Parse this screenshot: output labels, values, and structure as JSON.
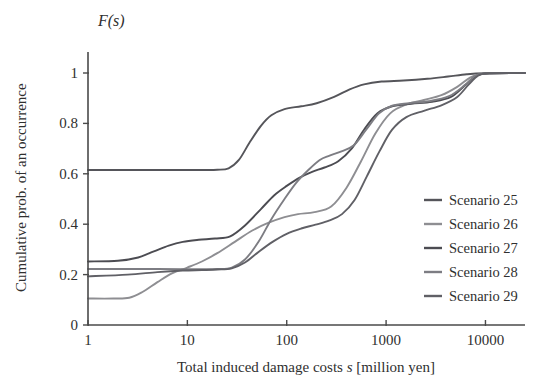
{
  "chart_data": {
    "type": "line",
    "title": "",
    "subtitle": "",
    "xlabel_parts": {
      "pre": "Total induced damage costs ",
      "symbol": "s",
      "post": "  [million yen]"
    },
    "xlabel": "Total induced damage costs s  [million yen]",
    "ylabel": "Cumulative prob. of  an occurrence",
    "corner_label": "F(s)",
    "xscale": "log",
    "xlim": [
      1,
      25000
    ],
    "ylim": [
      0,
      1
    ],
    "grid": false,
    "xticks": [
      1,
      10,
      100,
      1000,
      10000
    ],
    "xtick_labels": [
      "1",
      "10",
      "100",
      "1000",
      "10000"
    ],
    "yticks": [
      0,
      0.2,
      0.4,
      0.6,
      0.8,
      1
    ],
    "ytick_labels": [
      "0",
      "0.2",
      "0.4",
      "0.6",
      "0.8",
      "1"
    ],
    "legend_position": "right-middle",
    "series": [
      {
        "name": "Scenario 25",
        "color": "#55555a",
        "points": [
          [
            1,
            0.615
          ],
          [
            3,
            0.615
          ],
          [
            8,
            0.615
          ],
          [
            15,
            0.615
          ],
          [
            20,
            0.616
          ],
          [
            26,
            0.622
          ],
          [
            33,
            0.655
          ],
          [
            42,
            0.722
          ],
          [
            55,
            0.79
          ],
          [
            70,
            0.832
          ],
          [
            95,
            0.857
          ],
          [
            140,
            0.868
          ],
          [
            200,
            0.88
          ],
          [
            300,
            0.905
          ],
          [
            430,
            0.935
          ],
          [
            600,
            0.955
          ],
          [
            900,
            0.966
          ],
          [
            1500,
            0.97
          ],
          [
            2600,
            0.977
          ],
          [
            4200,
            0.986
          ],
          [
            6500,
            0.995
          ],
          [
            10000,
            0.999
          ],
          [
            25000,
            1.0
          ]
        ]
      },
      {
        "name": "Scenario 26",
        "color": "#8e8e92",
        "points": [
          [
            1,
            0.105
          ],
          [
            1.8,
            0.105
          ],
          [
            2.6,
            0.108
          ],
          [
            3.5,
            0.13
          ],
          [
            5,
            0.17
          ],
          [
            7,
            0.205
          ],
          [
            10,
            0.228
          ],
          [
            14,
            0.252
          ],
          [
            20,
            0.285
          ],
          [
            30,
            0.33
          ],
          [
            45,
            0.375
          ],
          [
            65,
            0.405
          ],
          [
            95,
            0.428
          ],
          [
            130,
            0.44
          ],
          [
            190,
            0.448
          ],
          [
            280,
            0.47
          ],
          [
            400,
            0.545
          ],
          [
            560,
            0.65
          ],
          [
            780,
            0.76
          ],
          [
            1100,
            0.84
          ],
          [
            1600,
            0.875
          ],
          [
            2400,
            0.893
          ],
          [
            3600,
            0.912
          ],
          [
            5200,
            0.945
          ],
          [
            7000,
            0.982
          ],
          [
            9000,
            0.996
          ],
          [
            12000,
            1.0
          ],
          [
            25000,
            1.0
          ]
        ]
      },
      {
        "name": "Scenario 27",
        "color": "#4c4c52",
        "points": [
          [
            1,
            0.252
          ],
          [
            2,
            0.255
          ],
          [
            3.2,
            0.268
          ],
          [
            4.6,
            0.292
          ],
          [
            6.5,
            0.315
          ],
          [
            9,
            0.33
          ],
          [
            13,
            0.338
          ],
          [
            19,
            0.343
          ],
          [
            27,
            0.352
          ],
          [
            38,
            0.395
          ],
          [
            55,
            0.46
          ],
          [
            75,
            0.515
          ],
          [
            100,
            0.552
          ],
          [
            135,
            0.585
          ],
          [
            180,
            0.608
          ],
          [
            240,
            0.625
          ],
          [
            330,
            0.65
          ],
          [
            450,
            0.7
          ],
          [
            600,
            0.775
          ],
          [
            820,
            0.84
          ],
          [
            1150,
            0.868
          ],
          [
            1800,
            0.878
          ],
          [
            2900,
            0.886
          ],
          [
            4500,
            0.905
          ],
          [
            6400,
            0.955
          ],
          [
            8200,
            0.99
          ],
          [
            11000,
            0.999
          ],
          [
            25000,
            1.0
          ]
        ]
      },
      {
        "name": "Scenario 28",
        "color": "#7d7d83",
        "points": [
          [
            1,
            0.222
          ],
          [
            2.5,
            0.222
          ],
          [
            5,
            0.222
          ],
          [
            9,
            0.221
          ],
          [
            14,
            0.221
          ],
          [
            20,
            0.222
          ],
          [
            28,
            0.228
          ],
          [
            38,
            0.26
          ],
          [
            52,
            0.33
          ],
          [
            70,
            0.42
          ],
          [
            95,
            0.5
          ],
          [
            125,
            0.565
          ],
          [
            165,
            0.615
          ],
          [
            215,
            0.655
          ],
          [
            270,
            0.672
          ],
          [
            350,
            0.688
          ],
          [
            470,
            0.712
          ],
          [
            630,
            0.775
          ],
          [
            850,
            0.84
          ],
          [
            1150,
            0.87
          ],
          [
            1700,
            0.88
          ],
          [
            2700,
            0.888
          ],
          [
            4300,
            0.908
          ],
          [
            6200,
            0.952
          ],
          [
            8000,
            0.99
          ],
          [
            11000,
            0.999
          ],
          [
            25000,
            1.0
          ]
        ]
      },
      {
        "name": "Scenario 29",
        "color": "#606066",
        "points": [
          [
            1,
            0.193
          ],
          [
            2.5,
            0.2
          ],
          [
            5,
            0.21
          ],
          [
            9,
            0.216
          ],
          [
            14,
            0.218
          ],
          [
            20,
            0.22
          ],
          [
            28,
            0.225
          ],
          [
            38,
            0.248
          ],
          [
            52,
            0.29
          ],
          [
            72,
            0.33
          ],
          [
            100,
            0.362
          ],
          [
            140,
            0.383
          ],
          [
            195,
            0.398
          ],
          [
            270,
            0.415
          ],
          [
            360,
            0.44
          ],
          [
            480,
            0.495
          ],
          [
            640,
            0.59
          ],
          [
            860,
            0.69
          ],
          [
            1150,
            0.775
          ],
          [
            1600,
            0.825
          ],
          [
            2400,
            0.85
          ],
          [
            3600,
            0.872
          ],
          [
            5200,
            0.905
          ],
          [
            6800,
            0.955
          ],
          [
            8500,
            0.99
          ],
          [
            11000,
            0.999
          ],
          [
            25000,
            1.0
          ]
        ]
      }
    ]
  },
  "legend": {
    "entries": [
      {
        "label": "Scenario 25",
        "color": "#55555a"
      },
      {
        "label": "Scenario 26",
        "color": "#8e8e92"
      },
      {
        "label": "Scenario 27",
        "color": "#4c4c52"
      },
      {
        "label": "Scenario 28",
        "color": "#7d7d83"
      },
      {
        "label": "Scenario 29",
        "color": "#606066"
      }
    ]
  },
  "style": {
    "axis_color": "#4a4a4a",
    "text_color": "#2f2f2f",
    "background": "#ffffff"
  }
}
